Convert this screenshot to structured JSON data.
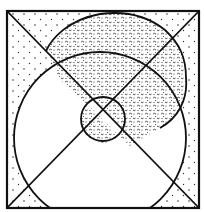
{
  "figure": {
    "type": "venn-style region diagram",
    "frame": {
      "x": 6,
      "y": 10,
      "width": 194,
      "height": 199
    },
    "colors": {
      "ink": "#111111",
      "background": "#ffffff",
      "sparse_dots": "#333333",
      "dense_texture": "#222222"
    },
    "regions": [
      {
        "id": "outer-square",
        "fill": "sparse-dots"
      },
      {
        "id": "large-circle",
        "fill": "white"
      },
      {
        "id": "blob",
        "fill": "dense-texture"
      },
      {
        "id": "center-circle",
        "fill": "split"
      }
    ]
  }
}
